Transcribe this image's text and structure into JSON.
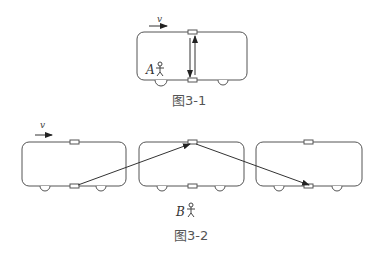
{
  "figure1": {
    "caption": "图3-1",
    "velocity_label": "v",
    "observer_label": "A",
    "light_path": "vertical round trip between floor and ceiling mirrors"
  },
  "figure2": {
    "caption": "图3-2",
    "velocity_label": "v",
    "observer_label": "B",
    "light_path": "diagonal path from floor (car 1) to ceiling (car 2) to floor (car 3)"
  },
  "colors": {
    "outline": "#555555",
    "ray": "#333333",
    "text": "#555555"
  }
}
